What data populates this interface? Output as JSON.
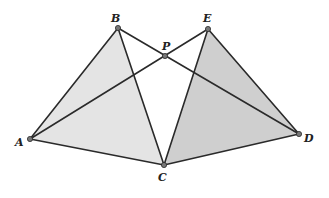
{
  "diagram": {
    "type": "geometry",
    "colors": {
      "background": "#ffffff",
      "stroke": "#2a2a2a",
      "triangle_abc_fill": "#e4e4e4",
      "triangle_ecd_fill": "#cfcfcf",
      "point_fill": "#777777"
    },
    "points": {
      "A": {
        "label": "A",
        "x": 30,
        "y": 139,
        "lx": 15,
        "ly": 146
      },
      "B": {
        "label": "B",
        "x": 118,
        "y": 28,
        "lx": 111,
        "ly": 22
      },
      "C": {
        "label": "C",
        "x": 164,
        "y": 165,
        "lx": 158,
        "ly": 181
      },
      "D": {
        "label": "D",
        "x": 299,
        "y": 134,
        "lx": 304,
        "ly": 142
      },
      "E": {
        "label": "E",
        "x": 208,
        "y": 29,
        "lx": 203,
        "ly": 22
      },
      "P": {
        "label": "P",
        "x": 165,
        "y": 56,
        "lx": 162,
        "ly": 50
      }
    },
    "shaded_triangles": [
      [
        "A",
        "B",
        "C"
      ],
      [
        "E",
        "C",
        "D"
      ]
    ],
    "segments": [
      [
        "A",
        "B"
      ],
      [
        "B",
        "C"
      ],
      [
        "A",
        "C"
      ],
      [
        "E",
        "C"
      ],
      [
        "E",
        "D"
      ],
      [
        "C",
        "D"
      ],
      [
        "A",
        "E"
      ],
      [
        "B",
        "D"
      ]
    ]
  }
}
